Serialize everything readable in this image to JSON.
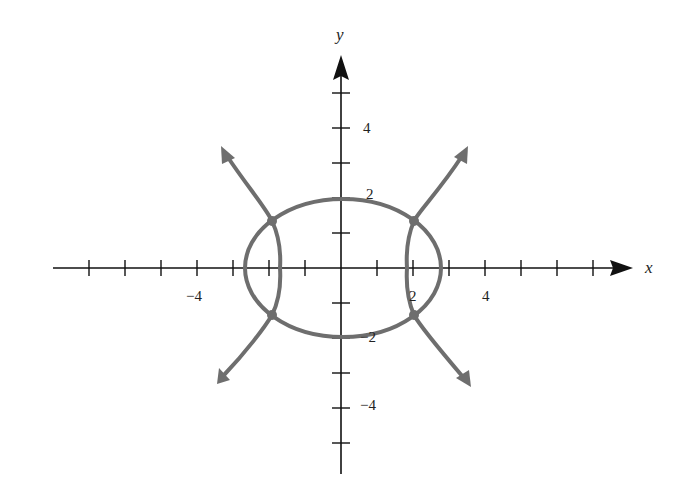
{
  "figure": {
    "type": "coordinate-plot",
    "axes": {
      "x_label": "x",
      "y_label": "y",
      "x_tick_labels": [
        {
          "value": -4,
          "text": "−4"
        },
        {
          "value": 2,
          "text": "2"
        },
        {
          "value": 4,
          "text": "4"
        }
      ],
      "y_tick_labels": [
        {
          "value": 4,
          "text": "4"
        },
        {
          "value": 2,
          "text": "2"
        },
        {
          "value": -2,
          "text": "−2"
        },
        {
          "value": -4,
          "text": "−4"
        }
      ],
      "x_ticks": [
        -7,
        -6,
        -5,
        -4,
        -3,
        -2,
        -1,
        1,
        2,
        3,
        4,
        5,
        6,
        7
      ],
      "y_ticks": [
        -5,
        -4,
        -3,
        -2,
        -1,
        1,
        2,
        3,
        4,
        5
      ],
      "x_range": [
        -8,
        8
      ],
      "y_range": [
        -6,
        6
      ]
    },
    "curves": [
      {
        "name": "ellipse",
        "kind": "ellipse",
        "center": [
          0,
          0
        ],
        "semi_axis_x": 2.7,
        "semi_axis_y": 1.95
      },
      {
        "name": "hyperbola-right",
        "kind": "hyperbola-branch",
        "vertex": [
          1.9,
          0
        ],
        "arrows": true
      },
      {
        "name": "hyperbola-left",
        "kind": "hyperbola-branch",
        "vertex": [
          -1.9,
          0
        ],
        "arrows": true
      }
    ],
    "intersection_points": [
      [
        -1.95,
        1.35
      ],
      [
        1.95,
        1.35
      ],
      [
        -1.95,
        -1.35
      ],
      [
        1.95,
        -1.35
      ]
    ],
    "colors": {
      "axes": "#111111",
      "curves": "#6e6e6e",
      "background": "#ffffff"
    }
  }
}
